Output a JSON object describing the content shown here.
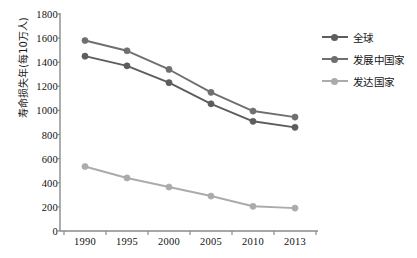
{
  "chart_data": {
    "type": "line",
    "title": "",
    "xlabel": "",
    "ylabel": "寿命损失年(每10万人)",
    "categories": [
      "1990",
      "1995",
      "2000",
      "2005",
      "2010",
      "2013"
    ],
    "x": [
      1990,
      1995,
      2000,
      2005,
      2010,
      2013
    ],
    "ylim": [
      0,
      1800
    ],
    "ytick_labels": [
      "0",
      "200",
      "400",
      "600",
      "800",
      "1000",
      "1200",
      "1400",
      "1600",
      "1800"
    ],
    "ytick_values": [
      0,
      200,
      400,
      600,
      800,
      1000,
      1200,
      1400,
      1600,
      1800
    ],
    "grid": false,
    "legend_position": "right",
    "series": [
      {
        "name": "全球",
        "color": "#5d5d5d",
        "values": [
          1450,
          1370,
          1230,
          1055,
          910,
          860
        ]
      },
      {
        "name": "发展中国家",
        "color": "#6f6f6f",
        "values": [
          1580,
          1495,
          1340,
          1150,
          995,
          945
        ]
      },
      {
        "name": "发达国家",
        "color": "#ababab",
        "values": [
          535,
          440,
          365,
          290,
          205,
          190
        ]
      }
    ]
  },
  "axis": {
    "color": "#8a8a8a"
  }
}
